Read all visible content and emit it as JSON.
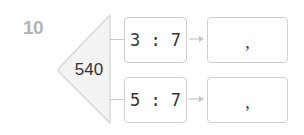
{
  "problem": {
    "number": "10",
    "total": "540",
    "rows": [
      {
        "ratio": "3 : 7",
        "answer_separator": ","
      },
      {
        "ratio": "5 : 7",
        "answer_separator": ","
      }
    ]
  },
  "colors": {
    "number": "#b4b4b4",
    "border": "#cfcfcf",
    "triangle_fill": "#f3f3f3",
    "text": "#333333"
  }
}
